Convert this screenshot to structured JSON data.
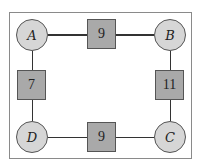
{
  "graph": {
    "nodes": [
      {
        "id": "A",
        "label": "A"
      },
      {
        "id": "B",
        "label": "B"
      },
      {
        "id": "C",
        "label": "C"
      },
      {
        "id": "D",
        "label": "D"
      }
    ],
    "edges": [
      {
        "from": "A",
        "to": "B",
        "weight": "9"
      },
      {
        "from": "A",
        "to": "D",
        "weight": "7"
      },
      {
        "from": "B",
        "to": "C",
        "weight": "11"
      },
      {
        "from": "D",
        "to": "C",
        "weight": "9"
      }
    ]
  },
  "colors": {
    "node_fill": "#d6d6d6",
    "weight_fill": "#a9a9a9",
    "line": "#333333",
    "frame": "#8a8a8a"
  }
}
